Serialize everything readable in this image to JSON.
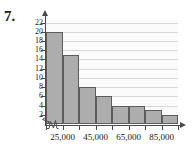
{
  "problem": {
    "number": "7."
  },
  "chart_data": {
    "type": "bar",
    "title": "",
    "subtitle": "",
    "xlabel": "",
    "ylabel": "",
    "grid": true,
    "legend": null,
    "axis_break": {
      "x": true,
      "y": true
    },
    "categories": [
      "15,000-25,000",
      "25,000-35,000",
      "35,000-45,000",
      "45,000-55,000",
      "55,000-65,000",
      "65,000-75,000",
      "75,000-85,000",
      "85,000-95,000"
    ],
    "values": [
      20,
      15,
      8,
      6,
      4,
      4,
      3,
      2
    ],
    "ylim": [
      0,
      23
    ],
    "ytick_labels": [
      "22",
      "20",
      "18",
      "16",
      "14",
      "12",
      "10",
      "8",
      "6",
      "4",
      "2"
    ],
    "ytick_values": [
      22,
      20,
      18,
      16,
      14,
      12,
      10,
      8,
      6,
      4,
      2
    ],
    "xtick_labels": [
      "25,000",
      "45,000",
      "65,000",
      "85,000"
    ],
    "xtick_values": [
      25000,
      45000,
      65000,
      85000
    ],
    "xlim": [
      15000,
      95000
    ],
    "bar_fill": "#adadad",
    "bar_stroke": "#5d5d5d",
    "gridline_color": "#d8d8d8",
    "axis_color": "#4a4a4a",
    "plot_background": "#fbfbfb"
  }
}
